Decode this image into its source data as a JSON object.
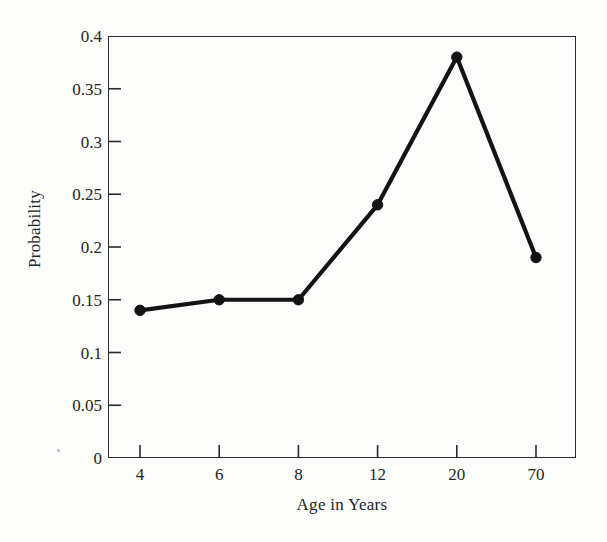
{
  "chart_data": {
    "type": "line",
    "title": "",
    "xlabel": "Age in Years",
    "ylabel": "Probability",
    "categories": [
      "4",
      "6",
      "8",
      "12",
      "20",
      "70"
    ],
    "values": [
      0.14,
      0.15,
      0.15,
      0.24,
      0.38,
      0.19
    ],
    "series": [
      {
        "name": "Probability",
        "values": [
          0.14,
          0.15,
          0.15,
          0.24,
          0.38,
          0.19
        ]
      }
    ],
    "ylim": [
      0,
      0.4
    ],
    "ytick_values": [
      0,
      0.05,
      0.1,
      0.15,
      0.2,
      0.25,
      0.3,
      0.35,
      0.4
    ],
    "ytick_labels": [
      "0",
      "0.05",
      "0.1",
      "0.15",
      "0.2",
      "0.25",
      "0.3",
      "0.35",
      "0.4"
    ],
    "xtick_labels": [
      "4",
      "6",
      "8",
      "12",
      "20",
      "70"
    ],
    "grid": false,
    "legend": "none",
    "marker": "filled-circle",
    "line_color": "#141414",
    "marker_color": "#141414",
    "axis_color": "#2b2b2b",
    "background_color": "#fdfdfc"
  }
}
